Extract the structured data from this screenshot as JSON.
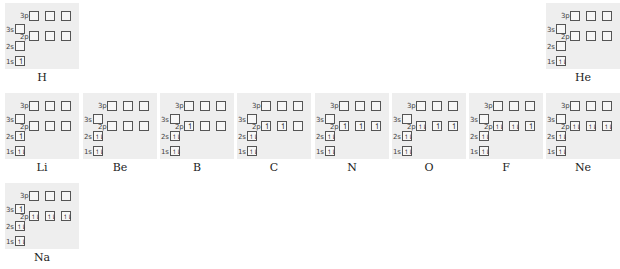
{
  "orbital_labels": {
    "p3": "3p",
    "s3": "3s",
    "p2": "2p",
    "s2": "2s",
    "s1": "1s"
  },
  "arrow_glyphs": {
    "up": "↿",
    "down": "⇂",
    "pair": "⥮"
  },
  "elements": [
    {
      "symbol": "H",
      "x": 5,
      "y": 3,
      "s1": "up",
      "s2": "",
      "p2": [
        "",
        "",
        ""
      ],
      "s3": "",
      "p3": [
        "",
        "",
        ""
      ]
    },
    {
      "symbol": "He",
      "x": 546,
      "y": 3,
      "s1": "pair",
      "s2": "",
      "p2": [
        "",
        "",
        ""
      ],
      "s3": "",
      "p3": [
        "",
        "",
        ""
      ]
    },
    {
      "symbol": "Li",
      "x": 5,
      "y": 93,
      "s1": "pair",
      "s2": "up",
      "p2": [
        "",
        "",
        ""
      ],
      "s3": "",
      "p3": [
        "",
        "",
        ""
      ]
    },
    {
      "symbol": "Be",
      "x": 83,
      "y": 93,
      "s1": "pair",
      "s2": "pair",
      "p2": [
        "",
        "",
        ""
      ],
      "s3": "",
      "p3": [
        "",
        "",
        ""
      ]
    },
    {
      "symbol": "B",
      "x": 160,
      "y": 93,
      "s1": "pair",
      "s2": "pair",
      "p2": [
        "up",
        "",
        ""
      ],
      "s3": "",
      "p3": [
        "",
        "",
        ""
      ]
    },
    {
      "symbol": "C",
      "x": 237,
      "y": 93,
      "s1": "pair",
      "s2": "pair",
      "p2": [
        "up",
        "up",
        ""
      ],
      "s3": "",
      "p3": [
        "",
        "",
        ""
      ]
    },
    {
      "symbol": "N",
      "x": 315,
      "y": 93,
      "s1": "pair",
      "s2": "pair",
      "p2": [
        "up",
        "up",
        "up"
      ],
      "s3": "",
      "p3": [
        "",
        "",
        ""
      ]
    },
    {
      "symbol": "O",
      "x": 392,
      "y": 93,
      "s1": "pair",
      "s2": "pair",
      "p2": [
        "pair",
        "up",
        "up"
      ],
      "s3": "",
      "p3": [
        "",
        "",
        ""
      ]
    },
    {
      "symbol": "F",
      "x": 469,
      "y": 93,
      "s1": "pair",
      "s2": "pair",
      "p2": [
        "pair",
        "pair",
        "up"
      ],
      "s3": "",
      "p3": [
        "",
        "",
        ""
      ]
    },
    {
      "symbol": "Ne",
      "x": 546,
      "y": 93,
      "s1": "pair",
      "s2": "pair",
      "p2": [
        "pair",
        "pair",
        "pair"
      ],
      "s3": "",
      "p3": [
        "",
        "",
        ""
      ]
    },
    {
      "symbol": "Na",
      "x": 5,
      "y": 183,
      "s1": "pair",
      "s2": "pair",
      "p2": [
        "pair",
        "pair",
        "pair"
      ],
      "s3": "up",
      "p3": [
        "",
        "",
        ""
      ]
    }
  ]
}
